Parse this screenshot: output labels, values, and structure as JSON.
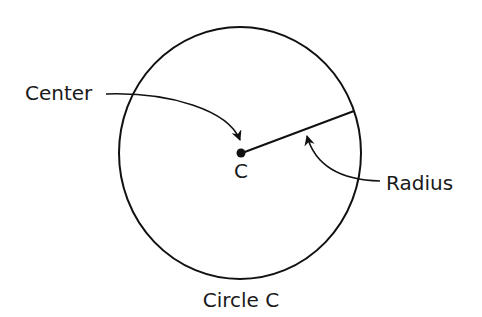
{
  "diagram": {
    "type": "circle-anatomy",
    "labels": {
      "center": "Center",
      "center_point": "C",
      "radius": "Radius",
      "caption": "Circle C"
    },
    "colors": {
      "stroke": "#111111",
      "text": "#1a1a1a",
      "background": "#ffffff"
    }
  }
}
